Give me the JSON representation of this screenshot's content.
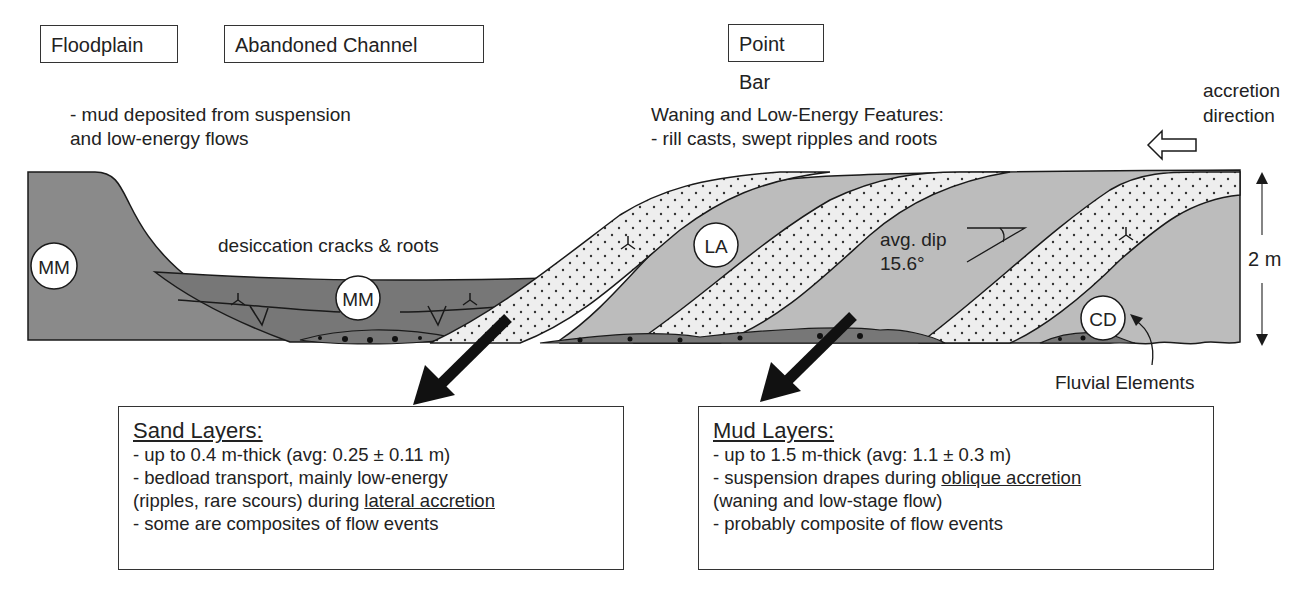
{
  "headers": {
    "floodplain": "Floodplain",
    "abandoned_channel": "Abandoned Channel",
    "point_bar": "Point Bar"
  },
  "notes": {
    "mud_line1": "- mud deposited from suspension",
    "mud_line2": "and low-energy flows",
    "waning_line1": "Waning and Low-Energy Features:",
    "waning_line2": "- rill casts, swept ripples and roots",
    "accretion_line1": "accretion",
    "accretion_line2": "direction",
    "desiccation": "desiccation cracks & roots",
    "dip_line1": "avg. dip",
    "dip_line2": "15.6°",
    "scale": "2 m",
    "fluvial": "Fluvial Elements"
  },
  "element_labels": {
    "mm_floodplain": "MM",
    "mm_channel": "MM",
    "la": "LA",
    "cd": "CD"
  },
  "sand_box": {
    "title": "Sand Layers:",
    "line1": "- up to 0.4 m-thick (avg: 0.25 ± 0.11 m)",
    "line2": "- bedload transport, mainly low-energy",
    "line3_pre": "(ripples, rare scours) during ",
    "line3_u": "lateral accretion",
    "line4": "- some are composites of flow events"
  },
  "mud_box": {
    "title": "Mud Layers:",
    "line1": "- up to 1.5 m-thick (avg: 1.1 ± 0.3 m)",
    "line2_pre": "- suspension drapes during ",
    "line2_u": "oblique accretion",
    "line3": "(waning and low-stage flow)",
    "line4": "- probably composite of flow events"
  },
  "colors": {
    "dark_mud": "#777777",
    "floodplain_mud": "#8a8a8a",
    "light_mud": "#bcbcbc",
    "sand": "#eeeeee",
    "outline": "#1a1a1a"
  },
  "icons": [
    "root-icon",
    "desiccation-crack-icon",
    "dip-angle-icon",
    "arrow-left-hollow-icon",
    "double-arrow-scale-icon",
    "thick-arrow-icon"
  ]
}
